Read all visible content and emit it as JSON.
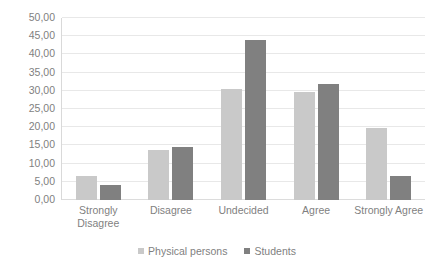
{
  "chart_data": {
    "type": "bar",
    "title": "",
    "subtitle": "",
    "xlabel": "",
    "ylabel": "",
    "categories": [
      "Strongly Disagree",
      "Disagree",
      "Undecided",
      "Agree",
      "Strongly Agree"
    ],
    "series": [
      {
        "name": "Physical persons",
        "color": "#C9C9C9",
        "values": [
          6.7,
          13.7,
          30.5,
          29.8,
          19.8
        ]
      },
      {
        "name": "Students",
        "color": "#808080",
        "values": [
          4.0,
          14.5,
          44.0,
          31.8,
          6.5
        ]
      }
    ],
    "ylim": [
      0,
      50
    ],
    "ytick_step": 5,
    "ytick_labels": [
      "0,00",
      "5,00",
      "10,00",
      "15,00",
      "20,00",
      "25,00",
      "30,00",
      "35,00",
      "40,00",
      "45,00",
      "50,00"
    ],
    "grid": true,
    "legend_position": "bottom"
  },
  "legend": {
    "entries": [
      {
        "label": "Physical persons"
      },
      {
        "label": "Students"
      }
    ]
  }
}
